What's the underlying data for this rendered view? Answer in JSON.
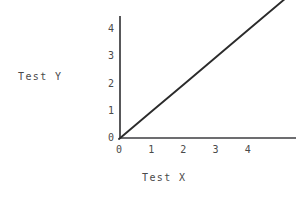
{
  "chart_data": {
    "type": "line",
    "title": "",
    "xlabel": "Test X",
    "ylabel": "Test Y",
    "xlim": [
      0,
      5.5
    ],
    "ylim": [
      0,
      4.6
    ],
    "xticks": [
      "0",
      "1",
      "2",
      "3",
      "4"
    ],
    "yticks": [
      "0",
      "1",
      "2",
      "3",
      "4"
    ],
    "xtick_values": [
      0,
      1,
      2,
      3,
      4
    ],
    "ytick_values": [
      0,
      1,
      2,
      3,
      4
    ],
    "grid": false,
    "legend": null,
    "series": [
      {
        "name": "y = x",
        "x": [
          0,
          1,
          2,
          3,
          4,
          5.5
        ],
        "values": [
          0,
          1,
          2,
          3,
          4,
          5.5
        ]
      }
    ],
    "line_color": "#2b2b2b",
    "axis_color": "#58585a",
    "background_color": "#ffffff"
  }
}
